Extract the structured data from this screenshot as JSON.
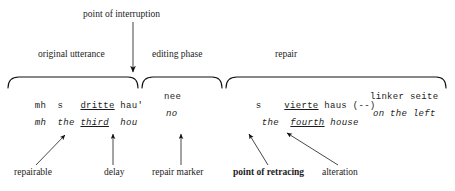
{
  "figure": {
    "top_annotation": "point of interruption",
    "phases": [
      {
        "label": "original utterance"
      },
      {
        "label": "editing phase"
      },
      {
        "label": "repair"
      }
    ],
    "transcript": {
      "surface": {
        "original": {
          "pre": "mh  s   ",
          "underlined": "dritte",
          "post": " hau'"
        },
        "editing": "nee",
        "repair_a": {
          "pre": "s    ",
          "underlined": "vierte",
          "post": " haus (--)"
        },
        "repair_b": "linker seite"
      },
      "gloss": {
        "original": {
          "pre": "mh  the ",
          "underlined": "third",
          "post": "  hou"
        },
        "editing": "no",
        "repair_a": {
          "pre": "the  ",
          "underlined": "fourth",
          "post": " house"
        },
        "repair_b": "on the left"
      }
    },
    "callouts": [
      {
        "label": "repairable",
        "bold": false
      },
      {
        "label": "delay",
        "bold": false
      },
      {
        "label": "repair marker",
        "bold": false
      },
      {
        "label": "point of retracing",
        "bold": true
      },
      {
        "label": "alteration",
        "bold": false
      }
    ],
    "colors": {
      "ink": "#1c1c1c",
      "background": "#ffffff",
      "rule": "#000000"
    }
  }
}
